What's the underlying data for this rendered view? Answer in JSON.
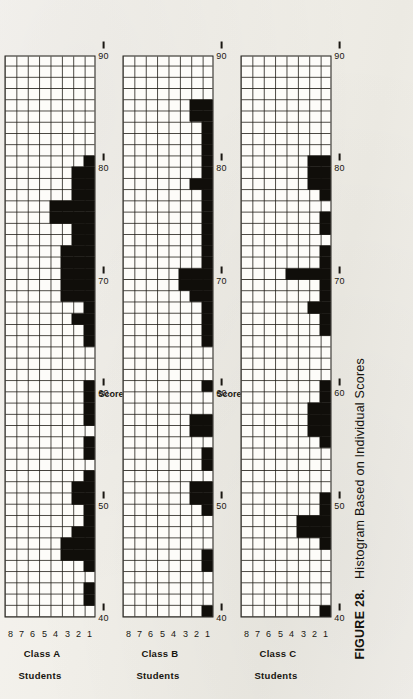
{
  "figure": {
    "number": "FIGURE 28.",
    "caption": "Histogram Based on Individual Scores"
  },
  "axis": {
    "x_label": "Scores",
    "y_label": "Students",
    "x_ticks": [
      "40",
      "50",
      "60",
      "70",
      "80",
      "90"
    ],
    "y_ticks": [
      "1",
      "2",
      "3",
      "4",
      "5",
      "6",
      "7",
      "8"
    ]
  },
  "panels": [
    {
      "id": "class-a",
      "label": "Class A"
    },
    {
      "id": "class-b",
      "label": "Class B"
    },
    {
      "id": "class-c",
      "label": "Class C"
    }
  ],
  "chart_data": [
    {
      "type": "bar",
      "title": "Class A",
      "xlabel": "Scores",
      "ylabel": "Students",
      "xlim": [
        40,
        90
      ],
      "ylim": [
        0,
        8
      ],
      "grid": true,
      "bin_width": 1,
      "categories": [
        40,
        41,
        42,
        43,
        44,
        45,
        46,
        47,
        48,
        49,
        50,
        51,
        52,
        53,
        54,
        55,
        56,
        57,
        58,
        59,
        60,
        61,
        62,
        63,
        64,
        65,
        66,
        67,
        68,
        69,
        70,
        71,
        72,
        73,
        74,
        75,
        76,
        77,
        78,
        79,
        80,
        81,
        82,
        83,
        84,
        85,
        86,
        87,
        88,
        89
      ],
      "values": [
        0,
        1,
        1,
        0,
        1,
        3,
        3,
        2,
        1,
        1,
        2,
        2,
        1,
        0,
        1,
        1,
        0,
        1,
        1,
        1,
        1,
        0,
        0,
        0,
        1,
        1,
        2,
        1,
        3,
        3,
        3,
        3,
        3,
        2,
        2,
        4,
        4,
        2,
        2,
        2,
        1,
        0,
        0,
        0,
        0,
        0,
        0,
        0,
        0,
        0
      ]
    },
    {
      "type": "bar",
      "title": "Class B",
      "xlabel": "Scores",
      "ylabel": "Students",
      "xlim": [
        40,
        90
      ],
      "ylim": [
        0,
        8
      ],
      "grid": true,
      "bin_width": 1,
      "categories": [
        40,
        41,
        42,
        43,
        44,
        45,
        46,
        47,
        48,
        49,
        50,
        51,
        52,
        53,
        54,
        55,
        56,
        57,
        58,
        59,
        60,
        61,
        62,
        63,
        64,
        65,
        66,
        67,
        68,
        69,
        70,
        71,
        72,
        73,
        74,
        75,
        76,
        77,
        78,
        79,
        80,
        81,
        82,
        83,
        84,
        85,
        86,
        87,
        88,
        89
      ],
      "values": [
        1,
        0,
        0,
        0,
        1,
        1,
        0,
        0,
        0,
        1,
        2,
        2,
        0,
        1,
        1,
        0,
        2,
        2,
        0,
        0,
        1,
        0,
        0,
        0,
        1,
        1,
        1,
        1,
        2,
        3,
        3,
        1,
        1,
        1,
        1,
        1,
        1,
        1,
        2,
        1,
        1,
        1,
        1,
        1,
        2,
        2,
        0,
        0,
        0,
        0
      ]
    },
    {
      "type": "bar",
      "title": "Class C",
      "xlabel": "Scores",
      "ylabel": "Students",
      "xlim": [
        40,
        90
      ],
      "ylim": [
        0,
        8
      ],
      "grid": true,
      "bin_width": 1,
      "categories": [
        40,
        41,
        42,
        43,
        44,
        45,
        46,
        47,
        48,
        49,
        50,
        51,
        52,
        53,
        54,
        55,
        56,
        57,
        58,
        59,
        60,
        61,
        62,
        63,
        64,
        65,
        66,
        67,
        68,
        69,
        70,
        71,
        72,
        73,
        74,
        75,
        76,
        77,
        78,
        79,
        80,
        81,
        82,
        83,
        84,
        85,
        86,
        87,
        88,
        89
      ],
      "values": [
        1,
        0,
        0,
        0,
        0,
        0,
        1,
        3,
        3,
        1,
        1,
        0,
        0,
        0,
        0,
        1,
        2,
        2,
        2,
        1,
        1,
        0,
        0,
        0,
        0,
        1,
        1,
        2,
        1,
        1,
        4,
        1,
        1,
        0,
        1,
        1,
        0,
        1,
        2,
        2,
        2,
        0,
        0,
        0,
        0,
        0,
        0,
        0,
        0,
        0
      ]
    }
  ],
  "colors": {
    "ink": "#100e0a",
    "paper": "#f2f0eb",
    "grid": "#191610"
  }
}
